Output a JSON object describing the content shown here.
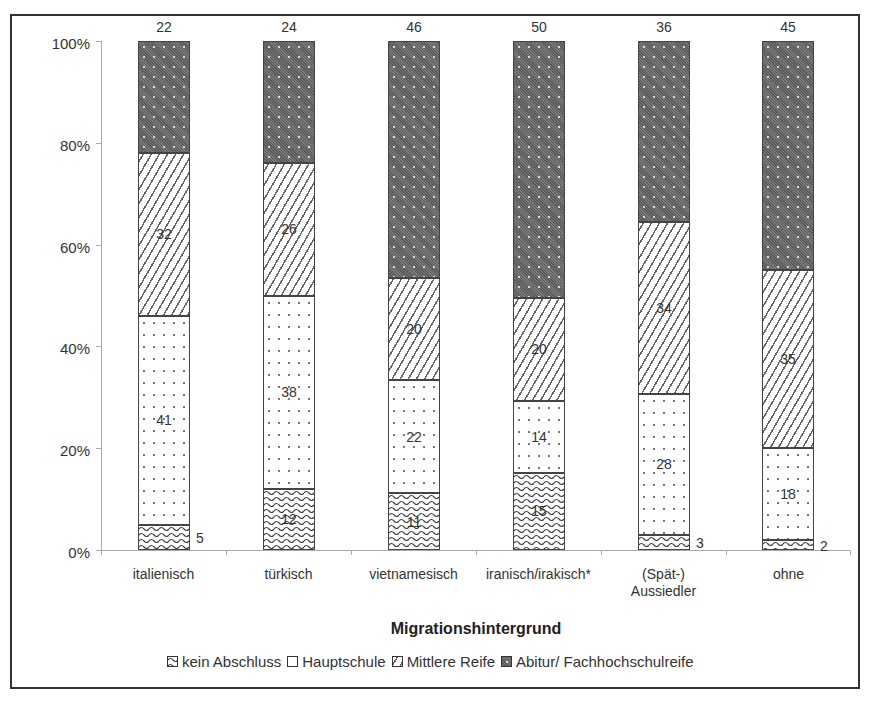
{
  "chart_data": {
    "type": "bar",
    "stacked": true,
    "normalized": true,
    "title": "",
    "xlabel": "Migrationshintergrund",
    "ylabel": "",
    "ylim": [
      0,
      100
    ],
    "yticks": [
      "0%",
      "20%",
      "40%",
      "60%",
      "80%",
      "100%"
    ],
    "categories": [
      "italienisch",
      "türkisch",
      "vietnamesisch",
      "iranisch/irakisch*",
      "(Spät-) Aussiedler",
      "ohne"
    ],
    "series": [
      {
        "name": "kein Abschluss",
        "values": [
          5,
          12,
          11,
          15,
          3,
          2
        ]
      },
      {
        "name": "Hauptschule",
        "values": [
          41,
          38,
          22,
          14,
          28,
          18
        ]
      },
      {
        "name": "Mittlere Reife",
        "values": [
          32,
          26,
          20,
          20,
          34,
          35
        ]
      },
      {
        "name": "Abitur/ Fachhochschulreife",
        "values": [
          22,
          24,
          46,
          50,
          36,
          45
        ]
      }
    ],
    "legend_position": "bottom",
    "grid": false
  },
  "axis": {
    "y_labels": [
      "100%",
      "80%",
      "60%",
      "40%",
      "20%",
      "0%"
    ],
    "x_title": "Migrationshintergrund",
    "x_categories": [
      {
        "line1": "italienisch",
        "line2": ""
      },
      {
        "line1": "türkisch",
        "line2": ""
      },
      {
        "line1": "vietnamesisch",
        "line2": ""
      },
      {
        "line1": "iranisch/irakisch*",
        "line2": ""
      },
      {
        "line1": "(Spät-)",
        "line2": "Aussiedler"
      },
      {
        "line1": "ohne",
        "line2": ""
      }
    ]
  },
  "bars": [
    {
      "kein": "5",
      "haupt": "41",
      "mittel": "32",
      "abitur": "22"
    },
    {
      "kein": "12",
      "haupt": "38",
      "mittel": "26",
      "abitur": "24"
    },
    {
      "kein": "11",
      "haupt": "22",
      "mittel": "20",
      "abitur": "46"
    },
    {
      "kein": "15",
      "haupt": "14",
      "mittel": "20",
      "abitur": "50"
    },
    {
      "kein": "3",
      "haupt": "28",
      "mittel": "34",
      "abitur": "36"
    },
    {
      "kein": "2",
      "haupt": "18",
      "mittel": "35",
      "abitur": "45"
    }
  ],
  "legend": {
    "items": [
      "kein Abschluss",
      "Hauptschule",
      "Mittlere Reife",
      "Abitur/ Fachhochschulreife"
    ]
  }
}
